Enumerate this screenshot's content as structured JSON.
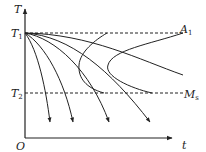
{
  "diagram": {
    "type": "CCT cooling curves diagram",
    "axes": {
      "y_label": "T",
      "x_label": "t",
      "origin_label": "O"
    },
    "levels": [
      {
        "name": "T1",
        "label_main": "T",
        "label_sub": "1",
        "right_label_main": "A",
        "right_label_sub": "1"
      },
      {
        "name": "T2",
        "label_main": "T",
        "label_sub": "2",
        "right_label_main": "M",
        "right_label_sub": "s"
      }
    ],
    "colors": {
      "line": "#222222",
      "background": "#ffffff"
    }
  }
}
